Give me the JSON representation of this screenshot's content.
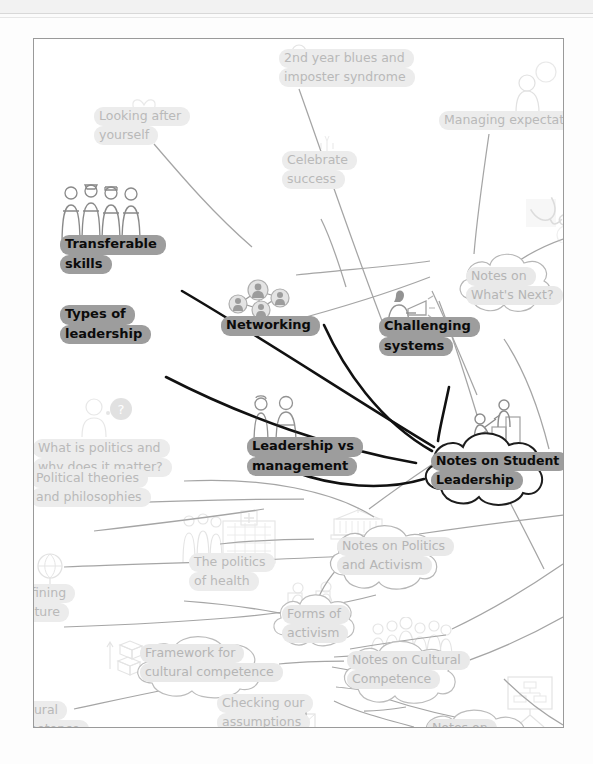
{
  "window": {
    "background_color": "#fdfdfd",
    "canvas_border_color": "#9a9a9a"
  },
  "colors": {
    "active_pill": "#9d9d9d",
    "active_text": "#0b0b0b",
    "inactive_pill": "#ececec",
    "inactive_text": "#b9b9b9",
    "active_link": "#111111",
    "inactive_link": "#9d9d9d"
  },
  "map": {
    "title": "Student life concept map",
    "nodes": [
      {
        "id": "second-year-blues",
        "label_lines": [
          "2nd year blues and",
          "imposter syndrome"
        ],
        "state": "inactive",
        "shape": "pill",
        "icon": "person-thinking-icon"
      },
      {
        "id": "managing-expectation",
        "label_lines": [
          "Managing expectation"
        ],
        "state": "inactive",
        "shape": "pill",
        "icon": "person-speech-bubble-icon"
      },
      {
        "id": "looking-after-yourself",
        "label_lines": [
          "Looking after",
          "yourself"
        ],
        "state": "inactive",
        "shape": "pill",
        "icon": "hands-heart-icon"
      },
      {
        "id": "celebrate-success",
        "label_lines": [
          "Celebrate",
          "success"
        ],
        "state": "inactive",
        "shape": "pill",
        "icon": "celebration-cake-icon"
      },
      {
        "id": "transferable-skills",
        "label_lines": [
          "Transferable",
          "skills"
        ],
        "state": "active",
        "shape": "pill",
        "icon": "group-professions-icon"
      },
      {
        "id": "networking",
        "label_lines": [
          "Networking"
        ],
        "state": "active",
        "shape": "pill",
        "icon": "network-people-icon"
      },
      {
        "id": "types-of-leadership",
        "label_lines": [
          "Types of",
          "leadership"
        ],
        "state": "active",
        "shape": "pill",
        "icon": "none"
      },
      {
        "id": "challenging-systems",
        "label_lines": [
          "Challenging",
          "systems"
        ],
        "state": "active",
        "shape": "pill",
        "icon": "megaphone-person-icon"
      },
      {
        "id": "what-is-politics",
        "label_lines": [
          "What is politics and",
          "why does it matter?"
        ],
        "state": "inactive",
        "shape": "pill",
        "icon": "person-question-icon"
      },
      {
        "id": "leadership-vs-management",
        "label_lines": [
          "Leadership vs",
          "management"
        ],
        "state": "active",
        "shape": "pill",
        "icon": "two-people-icon"
      },
      {
        "id": "notes-on-whats-next",
        "label_lines": [
          "Notes on",
          "What's Next?"
        ],
        "state": "inactive",
        "shape": "cloud",
        "icon": "none"
      },
      {
        "id": "notes-on-student-leadership",
        "label_lines": [
          "Notes on Student",
          "Leadership"
        ],
        "state": "active",
        "shape": "cloud",
        "icon": "helping-hand-steps-icon"
      },
      {
        "id": "political-theories",
        "label_lines": [
          "Political theories",
          "and philosophies"
        ],
        "state": "inactive",
        "shape": "pill",
        "icon": "none"
      },
      {
        "id": "the-politics-of-health",
        "label_lines": [
          "The politics",
          "of health"
        ],
        "state": "inactive",
        "shape": "pill",
        "icon": "hospital-people-icon"
      },
      {
        "id": "notes-on-politics-and-activism",
        "label_lines": [
          "Notes on Politics",
          "and Activism"
        ],
        "state": "inactive",
        "shape": "cloud",
        "icon": "government-building-icon"
      },
      {
        "id": "forms-of-activism",
        "label_lines": [
          "Forms of",
          "activism"
        ],
        "state": "inactive",
        "shape": "cloud",
        "icon": "protest-signs-icon"
      },
      {
        "id": "defining-culture",
        "label_lines": [
          "fining",
          "lture"
        ],
        "state": "inactive",
        "shape": "pill",
        "icon": "globe-icon",
        "clipped": "left"
      },
      {
        "id": "framework-cultural-competence",
        "label_lines": [
          "Framework for",
          "cultural competence"
        ],
        "state": "inactive",
        "shape": "cloud",
        "icon": "boxes-arrows-icon"
      },
      {
        "id": "notes-on-cultural-competence",
        "label_lines": [
          "Notes on Cultural",
          "Competence"
        ],
        "state": "inactive",
        "shape": "cloud",
        "icon": "crowd-people-icon"
      },
      {
        "id": "checking-our-assumptions",
        "label_lines": [
          "Checking our",
          "assumptions"
        ],
        "state": "inactive",
        "shape": "pill",
        "icon": "envelope-icon"
      },
      {
        "id": "cultural-competence-clipped",
        "label_lines": [
          "tural",
          "petence"
        ],
        "state": "inactive",
        "shape": "pill",
        "icon": "none",
        "clipped": "left"
      },
      {
        "id": "notes-on-bottom",
        "label_lines": [
          "Notes on"
        ],
        "state": "inactive",
        "shape": "cloud",
        "icon": "presentation-board-icon",
        "clipped": "bottom"
      }
    ],
    "icons": {
      "person-thinking": "person-thinking-icon",
      "person-speech-bubble": "person-speech-bubble-icon",
      "hands-heart": "hands-heart-icon",
      "celebration-cake": "celebration-cake-icon",
      "group-professions": "group-professions-icon",
      "network-people": "network-people-icon",
      "megaphone-person": "megaphone-person-icon",
      "person-question": "person-question-icon",
      "two-people": "two-people-icon",
      "helping-hand-steps": "helping-hand-steps-icon",
      "hospital-people": "hospital-people-icon",
      "government-building": "government-building-icon",
      "protest-signs": "protest-signs-icon",
      "globe": "globe-icon",
      "boxes-arrows": "boxes-arrows-icon",
      "crowd-people": "crowd-people-icon",
      "envelope": "envelope-icon",
      "presentation-board": "presentation-board-icon",
      "stethoscope": "stethoscope-icon"
    }
  }
}
